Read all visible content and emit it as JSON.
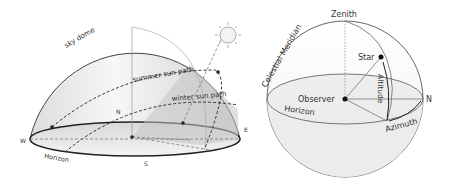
{
  "left_diagram": {
    "title": "Sky dome with sun paths",
    "labels": {
      "sky_dome": "sky dome",
      "summer": "summer sun path",
      "winter": "winter sun path",
      "north": "N",
      "south": "S",
      "east": "E",
      "west": "W",
      "horizon": "Horizon"
    }
  },
  "right_diagram": {
    "title": "Horizontal coordinate system",
    "labels": {
      "zenith": "Zenith",
      "meridian": "Celestial Meridian",
      "star": "Star",
      "altitude": "Altitude",
      "observer": "Observer",
      "north": "N",
      "horizon": "Horizon",
      "azimuth": "Azimuth"
    }
  },
  "colors": {
    "stroke": "#333333",
    "dome_fill": "#efefef",
    "shade": "#cfcfcf"
  }
}
